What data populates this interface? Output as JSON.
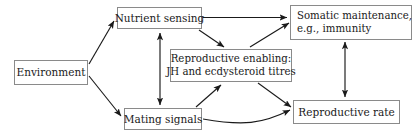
{
  "diagram": {
    "theme": {
      "background": "#ffffff",
      "box_border": "#8a8a8a",
      "box_fill": "#ffffff",
      "text": "#1a1a1a",
      "edge": "#1a1a1a"
    },
    "nodes": [
      {
        "id": "environment",
        "label": "Environment"
      },
      {
        "id": "nutrient",
        "label": "Nutrient sensing"
      },
      {
        "id": "mating",
        "label": "Mating signals"
      },
      {
        "id": "reproenable",
        "line1": "Reproductive enabling:",
        "line2": "JH and ecdysteroid titres"
      },
      {
        "id": "somatic",
        "line1": "Somatic maintenance,",
        "line2": "e.g., immunity"
      },
      {
        "id": "reprorate",
        "label": "Reproductive rate"
      }
    ],
    "edges": [
      {
        "from": "environment",
        "to": "nutrient",
        "style": "straight",
        "heads": "single"
      },
      {
        "from": "environment",
        "to": "mating",
        "style": "straight",
        "heads": "single"
      },
      {
        "from": "nutrient",
        "to": "somatic",
        "style": "straight",
        "heads": "single"
      },
      {
        "from": "nutrient",
        "to": "reproenable",
        "style": "straight",
        "heads": "single"
      },
      {
        "from": "nutrient",
        "to": "mating",
        "style": "straight",
        "heads": "double"
      },
      {
        "from": "mating",
        "to": "reproenable",
        "style": "straight",
        "heads": "single"
      },
      {
        "from": "mating",
        "to": "reprorate",
        "style": "curved",
        "heads": "single"
      },
      {
        "from": "reproenable",
        "to": "somatic",
        "style": "straight",
        "heads": "single"
      },
      {
        "from": "reproenable",
        "to": "reprorate",
        "style": "straight",
        "heads": "single"
      },
      {
        "from": "somatic",
        "to": "reprorate",
        "style": "straight",
        "heads": "double"
      }
    ]
  }
}
